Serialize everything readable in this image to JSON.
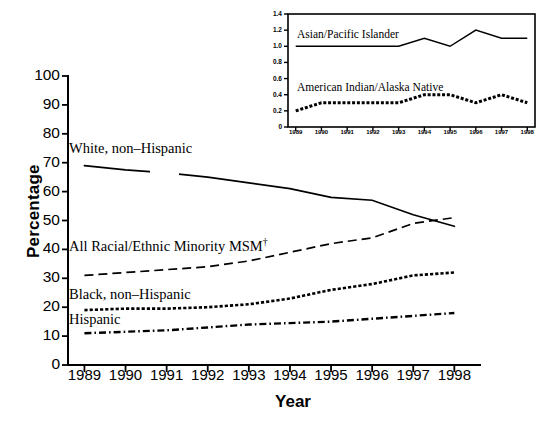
{
  "chart_data": [
    {
      "type": "line",
      "title": "",
      "xlabel": "Year",
      "ylabel": "Percentage",
      "x": [
        1989,
        1990,
        1991,
        1992,
        1993,
        1994,
        1995,
        1996,
        1997,
        1998
      ],
      "xlim": [
        1988.6,
        1998.6
      ],
      "ylim": [
        0,
        100
      ],
      "yticks": [
        0,
        10,
        20,
        30,
        40,
        50,
        60,
        70,
        80,
        90,
        100
      ],
      "xticks": [
        "1989",
        "1990",
        "1991",
        "1992",
        "1993",
        "1994",
        "1995",
        "1996",
        "1997",
        "1998"
      ],
      "grid": false,
      "legend": "inline-annotations",
      "series": [
        {
          "name": "White, non-Hispanic",
          "style": "solid",
          "values": [
            69,
            67.5,
            66.5,
            65,
            63,
            61,
            58,
            57,
            52,
            48
          ]
        },
        {
          "name": "All Racial/Ethnic Minority MSM†",
          "style": "dashed",
          "values": [
            31,
            32,
            33,
            34,
            36,
            39,
            42,
            44,
            49,
            51
          ]
        },
        {
          "name": "Black, non-Hispanic",
          "style": "dotted-heavy",
          "values": [
            19,
            19.5,
            19.5,
            20,
            21,
            23,
            26,
            28,
            31,
            32
          ]
        },
        {
          "name": "Hispanic",
          "style": "dash-dot",
          "values": [
            11,
            11.5,
            12,
            13,
            14,
            14.5,
            15,
            16,
            17,
            18
          ]
        }
      ]
    },
    {
      "type": "line",
      "title": "",
      "xlabel": "",
      "ylabel": "",
      "inset": true,
      "x": [
        1989,
        1990,
        1991,
        1992,
        1993,
        1994,
        1995,
        1996,
        1997,
        1998
      ],
      "xlim": [
        1988.7,
        1998.3
      ],
      "ylim": [
        0,
        1.4
      ],
      "yticks": [
        0,
        0.2,
        0.4,
        0.6,
        0.8,
        1.0,
        1.2,
        1.4
      ],
      "xticks": [
        "1989",
        "1990",
        "1991",
        "1992",
        "1993",
        "1994",
        "1995",
        "1996",
        "1997",
        "1998"
      ],
      "grid": false,
      "series": [
        {
          "name": "Asian/Pacific Islander",
          "style": "solid",
          "values": [
            1.0,
            1.0,
            1.0,
            1.0,
            1.0,
            1.1,
            1.0,
            1.2,
            1.1,
            1.1
          ]
        },
        {
          "name": "American Indian/Alaska Native",
          "style": "dotted-heavy",
          "values": [
            0.2,
            0.3,
            0.3,
            0.3,
            0.3,
            0.4,
            0.4,
            0.3,
            0.4,
            0.3
          ]
        }
      ]
    }
  ],
  "main_chart": {
    "ylabel": "Percentage",
    "xlabel": "Year",
    "yticks": [
      "100",
      "90",
      "80",
      "70",
      "60",
      "50",
      "40",
      "30",
      "20",
      "10",
      "0"
    ],
    "xticks": [
      "1989",
      "1990",
      "1991",
      "1992",
      "1993",
      "1994",
      "1995",
      "1996",
      "1997",
      "1998"
    ],
    "series_labels": {
      "white": "White, non–Hispanic",
      "minority": "All Racial/Ethnic Minority MSM",
      "minority_marker": "†",
      "black": "Black, non–Hispanic",
      "hispanic": "Hispanic"
    }
  },
  "inset_chart": {
    "yticks": [
      "1.4",
      "1.2",
      "1.0",
      "0.8",
      "0.6",
      "0.4",
      "0.2",
      "0"
    ],
    "xticks": [
      "1989",
      "1990",
      "1991",
      "1992",
      "1993",
      "1994",
      "1995",
      "1996",
      "1997",
      "1998"
    ],
    "series_labels": {
      "asian": "Asian/Pacific Islander",
      "native": "American Indian/Alaska Native"
    }
  },
  "colors": {
    "ink": "#000000",
    "background": "#ffffff"
  }
}
